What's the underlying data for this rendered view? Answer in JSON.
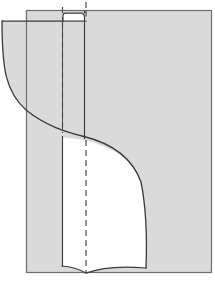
{
  "figure": {
    "title": "",
    "domain": "technical-line-drawing",
    "canvas": {
      "width": 215,
      "height": 285
    },
    "colors": {
      "background": "#ffffff",
      "panel_fill": "#d9d9d9",
      "panel_fill_alt": "#dcdcdc",
      "white_fill": "#ffffff",
      "outline": "#3b3b3b",
      "outline_soft": "#555555",
      "frame_border": "#6e6e6e",
      "dashed_line": "#4a4a4a"
    },
    "stroke_widths": {
      "frame": 1.2,
      "outline": 1.3,
      "thin": 1.0,
      "dashed": 1.2
    }
  },
  "geometry": {
    "frame": {
      "name": "outer-panel",
      "x": 26,
      "y": 10,
      "width": 186,
      "height": 263,
      "note": "large grey rectangular panel with thin dark border"
    },
    "upper_left_panel": {
      "name": "upper-left-flap",
      "top_y": 21,
      "left_x": 2,
      "right_x": 84,
      "note": "grey region extending left of the main panel, bounded below by a concave curve"
    },
    "left_curve": {
      "name": "left-sweep",
      "start": [
        2,
        21
      ],
      "control1": [
        3,
        78
      ],
      "control2": [
        30,
        106
      ],
      "end": [
        84,
        131
      ],
      "note": "concave sweep from top-left corner down-right"
    },
    "s_curve": {
      "name": "s-sweep-main",
      "start": [
        84,
        131
      ],
      "points": [
        [
          84,
          131
        ],
        [
          116,
          143
        ],
        [
          136,
          156
        ],
        [
          145,
          184
        ],
        [
          147,
          232
        ],
        [
          146,
          268
        ]
      ],
      "note": "S shaped seam running from mid-left to the bottom edge"
    },
    "white_region": {
      "name": "white-inner-face",
      "left_x": 62,
      "top_y": 136,
      "bottom_y": 270,
      "note": "white inner panel bounded right by the S curve and below by a shallow dip"
    },
    "bottom_dip": {
      "name": "bottom-dip-curve",
      "left": [
        62,
        266
      ],
      "mid": [
        85,
        272
      ],
      "apex": [
        86,
        273
      ],
      "right": [
        146,
        268
      ],
      "note": "shallow V/valley at the bottom where the fold meets the base line"
    },
    "vertical_lines": [
      {
        "name": "fold-line-left",
        "x": 62,
        "y1": 136,
        "y2": 270,
        "style": "solid"
      },
      {
        "name": "fold-line-upper",
        "x": 62,
        "y1": 21,
        "y2": 131,
        "style": "solid"
      },
      {
        "name": "edge-line-right",
        "x": 84,
        "y1": 10,
        "y2": 136,
        "style": "solid"
      }
    ],
    "dashed_lines": [
      {
        "name": "centerline-upper",
        "x": 62,
        "y1": 6,
        "y2": 133,
        "style": "dashed",
        "dash": "6 4"
      },
      {
        "name": "centerline-lower",
        "x": 86,
        "y1": 140,
        "y2": 273,
        "style": "dashed",
        "dash": "6 4"
      },
      {
        "name": "centerline-top",
        "x": 86,
        "y1": 2,
        "y2": 22,
        "style": "dashed",
        "dash": "6 4"
      }
    ],
    "notch": {
      "name": "top-tab-notch",
      "x": 63,
      "y": 14,
      "width": 22,
      "height": 8,
      "note": "small white rounded tab at the top between the two vertical lines"
    }
  },
  "labels": {
    "none_visible": ""
  }
}
